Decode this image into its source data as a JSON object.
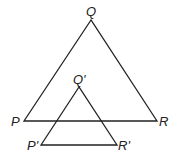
{
  "diagram": {
    "type": "geometry",
    "stroke_color": "#222222",
    "triangles": [
      {
        "name": "PQR",
        "vertices": {
          "Q": {
            "label": "Q",
            "x": 91,
            "y": 20
          },
          "P": {
            "label": "P",
            "x": 24,
            "y": 121
          },
          "R": {
            "label": "R",
            "x": 157,
            "y": 121
          }
        }
      },
      {
        "name": "P'Q'R'",
        "vertices": {
          "Q": {
            "label": "Q'",
            "x": 79,
            "y": 87
          },
          "P": {
            "label": "P'",
            "x": 41,
            "y": 145
          },
          "R": {
            "label": "R'",
            "x": 117,
            "y": 145
          }
        }
      }
    ]
  }
}
